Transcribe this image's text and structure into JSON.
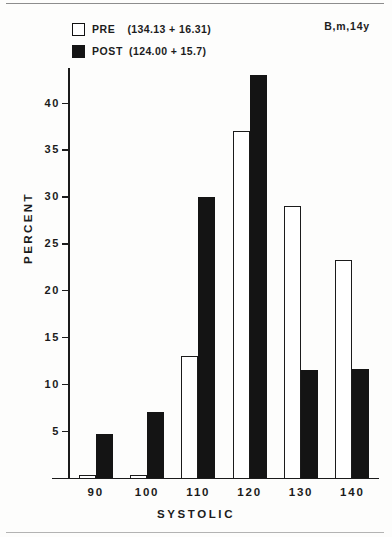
{
  "legend": {
    "pre": {
      "label": "PRE",
      "stat": "(134.13 + 16.31)",
      "swatch": "open-square-icon"
    },
    "post": {
      "label": "POST",
      "stat": "(124.00 + 15.7)",
      "swatch": "filled-square-icon"
    }
  },
  "subject_tag": "B,m,14y",
  "chart_data": {
    "type": "bar",
    "title": "",
    "subtitle": "B,m,14y",
    "xlabel": "SYSTOLIC",
    "ylabel": "PERCENT",
    "categories": [
      "90",
      "100",
      "110",
      "120",
      "130",
      "140"
    ],
    "series": [
      {
        "name": "PRE",
        "legend_text": "PRE  (134.13 + 16.31)",
        "mean": 134.13,
        "sd": 16.31,
        "fill": "#ffffff",
        "stroke": "#1b1b1b",
        "values": [
          0.3,
          0.3,
          13.0,
          37.0,
          29.0,
          23.3
        ]
      },
      {
        "name": "POST",
        "legend_text": "POST (124.00 + 15.7)",
        "mean": 124.0,
        "sd": 15.7,
        "fill": "#141414",
        "stroke": "#141414",
        "values": [
          4.7,
          7.0,
          30.0,
          43.0,
          11.5,
          11.6
        ]
      }
    ],
    "ylim": [
      0,
      43.8
    ],
    "yticks": [
      5,
      10,
      15,
      20,
      25,
      30,
      35,
      40
    ],
    "ytick_labels": [
      "5",
      "10",
      "15",
      "20",
      "25",
      "30",
      "35",
      "40"
    ],
    "grid": false,
    "legend_position": "top-left",
    "axis_color": "#1b1b1b",
    "background": "#fdfdfc"
  }
}
